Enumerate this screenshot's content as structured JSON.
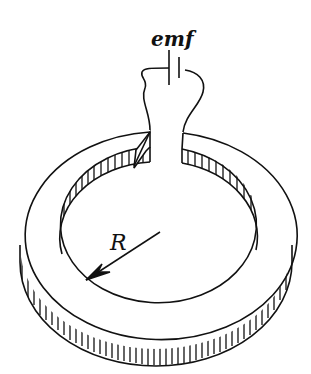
{
  "figure": {
    "labels": {
      "emf": "emf",
      "radius": "R"
    },
    "colors": {
      "stroke": "#111111",
      "background": "#ffffff"
    }
  }
}
